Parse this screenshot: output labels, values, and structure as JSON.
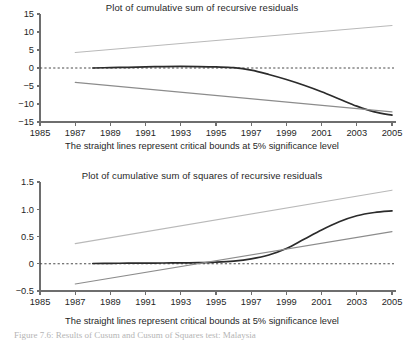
{
  "caption": "Figure 7.6: Results of Cusum and Cusum of Squares test: Malaysia",
  "colors": {
    "data_line": "#2b2b2b",
    "bound_upper": "#b9b9b9",
    "bound_lower": "#8c8c8c",
    "zero_line": "#4a4a4a",
    "axis": "#6e6e6e",
    "caption": "#b4b4b4"
  },
  "panels": [
    {
      "id": "cusum",
      "title": "Plot of cumulative sum of recursive residuals",
      "subtitle": "The straight lines represent critical bounds at 5% significance level"
    },
    {
      "id": "cusumsq",
      "title": "Plot of cumulative sum of squares of recursive residuals",
      "subtitle": "The straight lines represent critical bounds at 5% significance level"
    }
  ],
  "chart_data": [
    {
      "type": "line",
      "id": "cusum",
      "title": "Plot of cumulative sum of recursive residuals",
      "subtitle": "The straight lines represent critical bounds at 5% significance level",
      "xlabel": "",
      "ylabel": "",
      "xlim": [
        1985,
        2005
      ],
      "ylim": [
        -15,
        15
      ],
      "xticks": [
        1985,
        1987,
        1989,
        1991,
        1993,
        1995,
        1997,
        1999,
        2001,
        2003,
        2005
      ],
      "yticks": [
        15,
        10,
        5,
        0,
        -5,
        -10,
        -15
      ],
      "ytick_labels": [
        "15",
        "10",
        "5",
        "0",
        "-5",
        "-10",
        "-15"
      ],
      "grid": false,
      "legend": "none",
      "zero_line": 0,
      "series": [
        {
          "name": "CUSUM",
          "style": "solid-dark",
          "x": [
            1988,
            1989,
            1990,
            1991,
            1992,
            1993,
            1994,
            1995,
            1996,
            1997,
            1998,
            1999,
            2000,
            2001,
            2002,
            2003,
            2004,
            2005
          ],
          "values": [
            0.0,
            0.1,
            0.2,
            0.3,
            0.4,
            0.45,
            0.4,
            0.3,
            0.1,
            -0.6,
            -1.8,
            -3.2,
            -4.8,
            -6.6,
            -8.6,
            -10.6,
            -12.2,
            -13.1
          ]
        },
        {
          "name": "Upper critical bound (5%)",
          "style": "solid-light",
          "x": [
            1987,
            2005
          ],
          "values": [
            4.3,
            11.8
          ]
        },
        {
          "name": "Lower critical bound (5%)",
          "style": "solid-light",
          "x": [
            1987,
            2005
          ],
          "values": [
            -4.0,
            -12.2
          ]
        }
      ]
    },
    {
      "type": "line",
      "id": "cusumsq",
      "title": "Plot of cumulative sum of squares of recursive residuals",
      "subtitle": "The straight lines represent critical bounds at 5% significance level",
      "xlabel": "",
      "ylabel": "",
      "xlim": [
        1985,
        2005
      ],
      "ylim": [
        -0.5,
        1.5
      ],
      "xticks": [
        1985,
        1987,
        1989,
        1991,
        1993,
        1995,
        1997,
        1999,
        2001,
        2003,
        2005
      ],
      "yticks": [
        1.5,
        1.0,
        0.5,
        0,
        -0.5
      ],
      "ytick_labels": [
        "1.5",
        "1.0",
        "0.5",
        "0",
        "-0.5"
      ],
      "grid": false,
      "legend": "none",
      "zero_line": 0,
      "series": [
        {
          "name": "CUSUM of squares",
          "style": "solid-dark",
          "x": [
            1988,
            1989,
            1990,
            1991,
            1992,
            1993,
            1994,
            1995,
            1996,
            1997,
            1998,
            1999,
            2000,
            2001,
            2002,
            2003,
            2004,
            2005
          ],
          "values": [
            0.005,
            0.008,
            0.01,
            0.012,
            0.014,
            0.016,
            0.02,
            0.03,
            0.05,
            0.09,
            0.16,
            0.28,
            0.45,
            0.62,
            0.77,
            0.88,
            0.94,
            0.97
          ]
        },
        {
          "name": "Upper critical bound (5%)",
          "style": "solid-light",
          "x": [
            1987,
            2005
          ],
          "values": [
            0.37,
            1.35
          ]
        },
        {
          "name": "Lower critical bound (5%)",
          "style": "solid-light",
          "x": [
            1987,
            2005
          ],
          "values": [
            -0.37,
            0.59
          ]
        }
      ]
    }
  ]
}
